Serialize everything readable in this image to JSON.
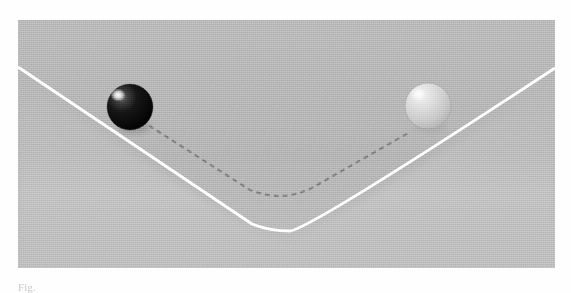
{
  "page": {
    "width": 571,
    "height": 293,
    "background_color": "#fefefe"
  },
  "figure": {
    "name": "double-well-potential-with-spheres",
    "panel": {
      "x": 18,
      "y": 20,
      "width": 537,
      "height": 248,
      "background_color": "#b2b2b2",
      "texture": "scanned-grain-noise"
    },
    "solid_curve": {
      "label": "solid-white-v-curve",
      "color": "#ffffff",
      "stroke_width": 2.6,
      "style": "solid",
      "points": [
        [
          0,
          47
        ],
        [
          236,
          205
        ],
        [
          254,
          208
        ],
        [
          272,
          208
        ],
        [
          290,
          204
        ],
        [
          537,
          48
        ]
      ]
    },
    "dashed_curve": {
      "label": "dashed-gray-v-curve",
      "color": "#7a7a7a",
      "stroke_width": 2.2,
      "style": "dashed",
      "dash_pattern": "5 4",
      "points": [
        [
          116,
          96
        ],
        [
          232,
          170
        ],
        [
          254,
          175
        ],
        [
          272,
          175
        ],
        [
          292,
          170
        ],
        [
          392,
          112
        ]
      ]
    },
    "spheres": [
      {
        "name": "dark-sphere",
        "cx": 112,
        "cy": 87,
        "r": 23,
        "base_color": "#191919",
        "shade_color": "#000000",
        "rim_color": "#3a3a3a",
        "highlight": {
          "cx": 101,
          "cy": 76,
          "r": 6,
          "color": "#ffffff"
        }
      },
      {
        "name": "light-sphere",
        "cx": 410,
        "cy": 86,
        "r": 23,
        "base_color": "#d8d8d8",
        "shade_color": "#a8a8a8",
        "rim_color": "#bcbcbc",
        "highlight": {
          "cx": 400,
          "cy": 74,
          "r": 7,
          "color": "#f8f8f8"
        }
      }
    ],
    "floor_shading": {
      "name": "valley-floor-lighter-band",
      "color": "#bdbdbd",
      "opacity": 0.45
    }
  },
  "caption": {
    "text": "Fig.",
    "color": "#c9c9c9",
    "clipped": true
  }
}
